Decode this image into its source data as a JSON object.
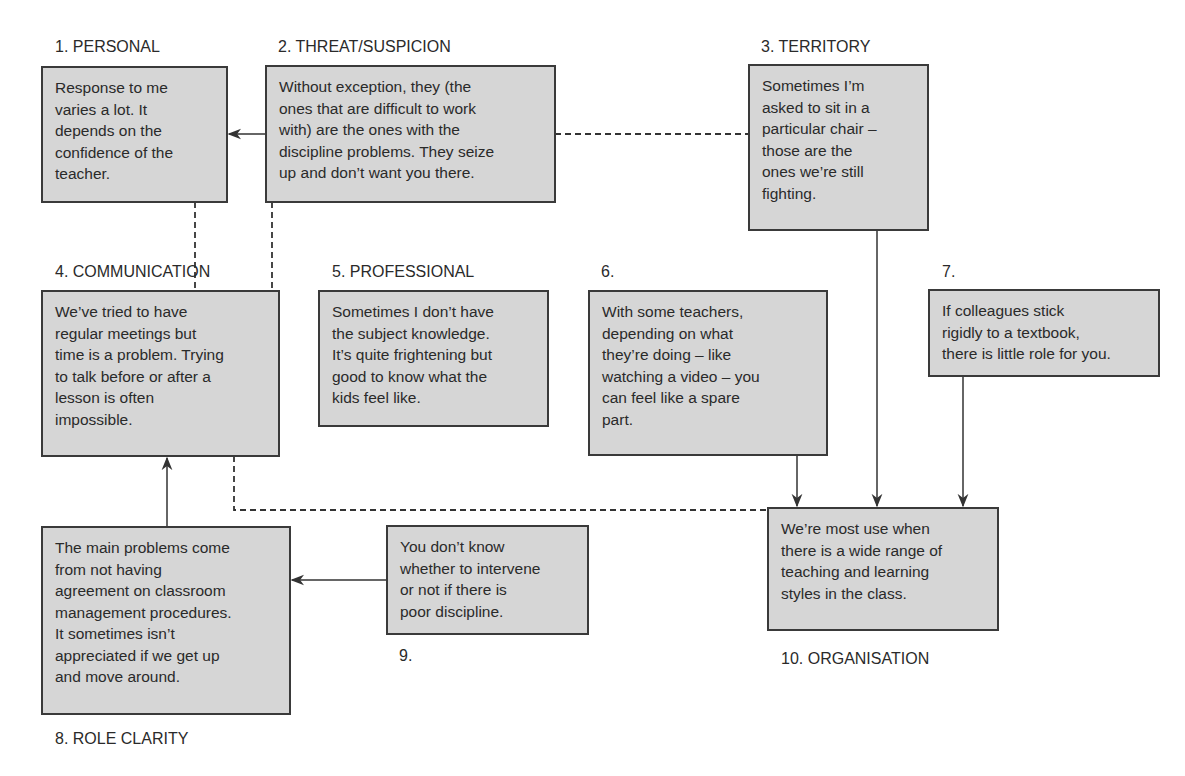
{
  "diagram": {
    "nodes": [
      {
        "id": "1",
        "label": "1. PERSONAL",
        "text": "Response to me\nvaries a lot. It\ndepends on the\nconfidence of the\nteacher."
      },
      {
        "id": "2",
        "label": "2. THREAT/SUSPICION",
        "text": "Without exception, they (the\nones that are difficult to work\nwith) are the ones with the\ndiscipline problems. They seize\nup and don’t want you there."
      },
      {
        "id": "3",
        "label": "3. TERRITORY",
        "text": "Sometimes I’m\nasked to sit in a\nparticular chair –\nthose are the\nones we’re still\nfighting."
      },
      {
        "id": "4",
        "label": "4. COMMUNICATION",
        "text": "We’ve tried to have\nregular meetings but\ntime is a problem. Trying\nto talk before or after a\nlesson is often\nimpossible."
      },
      {
        "id": "5",
        "label": "5. PROFESSIONAL",
        "text": "Sometimes I don’t have\nthe subject knowledge.\nIt’s quite frightening but\ngood to know what the\nkids feel like."
      },
      {
        "id": "6",
        "label": "6.",
        "text": "With some teachers,\ndepending on what\nthey’re doing – like\nwatching a video – you\ncan feel like a spare\npart."
      },
      {
        "id": "7",
        "label": "7.",
        "text": "If colleagues stick\nrigidly to a textbook,\nthere is little role for you."
      },
      {
        "id": "8",
        "label": "8. ROLE CLARITY",
        "text": "The main problems come\nfrom not having\nagreement on classroom\nmanagement procedures.\nIt sometimes isn’t\nappreciated if we get up\nand move around."
      },
      {
        "id": "9",
        "label": "9.",
        "text": "You don’t know\nwhether to intervene\nor not if there is\npoor discipline."
      },
      {
        "id": "10",
        "label": "10. ORGANISATION",
        "text": "We’re most use when\nthere is a wide range of\nteaching and learning\nstyles in the class."
      }
    ],
    "edges": [
      {
        "from": "2",
        "to": "1",
        "style": "solid-arrow"
      },
      {
        "from": "2",
        "to": "3",
        "style": "dashed"
      },
      {
        "from": "1",
        "to": "4",
        "style": "dashed"
      },
      {
        "from": "2",
        "to": "4",
        "style": "dashed"
      },
      {
        "from": "8",
        "to": "4",
        "style": "solid-arrow"
      },
      {
        "from": "4",
        "to": "10",
        "style": "dashed"
      },
      {
        "from": "9",
        "to": "8",
        "style": "solid-arrow"
      },
      {
        "from": "6",
        "to": "10",
        "style": "solid-arrow"
      },
      {
        "from": "3",
        "to": "10",
        "style": "solid-arrow"
      },
      {
        "from": "7",
        "to": "10",
        "style": "solid-arrow"
      }
    ],
    "colors": {
      "box_fill": "#d6d6d6",
      "box_border": "#3a3a3a",
      "line": "#333333"
    }
  }
}
